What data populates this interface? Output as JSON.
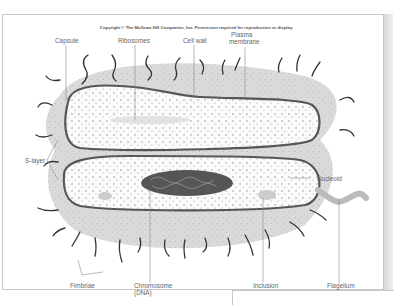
{
  "figure": {
    "copyright": "Copyright © The McGraw-Hill Companies, Inc. Permission required for reproduction or display.",
    "labels": {
      "capsule": "Capsule",
      "ribosomes": "Ribosomes",
      "cell_wall": "Cell wall",
      "plasma_membrane_1": "Plasma",
      "plasma_membrane_2": "membrane",
      "s_layer": "S-layer",
      "nucleoid": "Nucleoid",
      "fimbriae": "Fimbriae",
      "chromosome_1": "Chromosome",
      "chromosome_2": "(DNA)",
      "inclusion": "Inclusion",
      "flagellum": "Flagellum"
    }
  },
  "colors": {
    "capsule_fill": "#d9d9d9",
    "cell_interior": "#fafafa",
    "membrane": "#555555",
    "nucleoid": "#555555",
    "label_text": "#666666",
    "frame": "#c8c8c8"
  }
}
